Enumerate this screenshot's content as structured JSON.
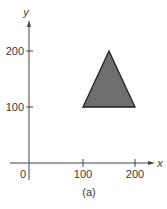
{
  "figure": {
    "caption": "(a)",
    "colors": {
      "axis": "#444444",
      "triangle_fill": "#6e6e6e",
      "triangle_stroke": "#1e1e1e",
      "text": "#3a3a3a"
    }
  },
  "axes": {
    "x_label": "x",
    "y_label": "y",
    "origin_label": "0",
    "x_ticks": [
      {
        "value": 100,
        "label": "100"
      },
      {
        "value": 200,
        "label": "200"
      }
    ],
    "y_ticks": [
      {
        "value": 100,
        "label": "100"
      },
      {
        "value": 200,
        "label": "200"
      }
    ]
  },
  "shape": {
    "type": "triangle",
    "vertices": [
      [
        100,
        100
      ],
      [
        200,
        100
      ],
      [
        150,
        200
      ]
    ]
  }
}
